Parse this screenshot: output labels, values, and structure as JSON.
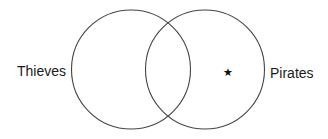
{
  "diagram": {
    "type": "venn",
    "sets": [
      {
        "id": "left",
        "label": "Thieves",
        "cx": 131,
        "cy": 69.5,
        "r": 59.5
      },
      {
        "id": "right",
        "label": "Pirates",
        "cx": 205,
        "cy": 69.5,
        "r": 59.5
      }
    ],
    "marker": {
      "glyph": "★",
      "region": "Pirates only",
      "x": 228,
      "y": 76
    },
    "colors": {
      "stroke": "#444444",
      "text": "#1a1a1a",
      "background": "#ffffff"
    }
  }
}
